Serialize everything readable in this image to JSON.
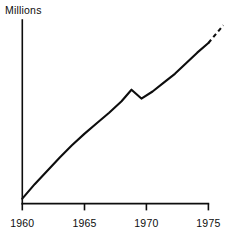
{
  "chart_data": {
    "type": "line",
    "title": "",
    "subtitle": "",
    "xlabel": "",
    "ylabel": "Millions",
    "xlim": [
      1960,
      1976.2
    ],
    "ylim": [
      0,
      10.4
    ],
    "grid": false,
    "legend": null,
    "axis_style": "L-shaped spine, ticks below x-axis, no y-axis tick labels",
    "xticks": [
      1960,
      1965,
      1970,
      1975
    ],
    "xtick_labels": [
      "1960",
      "1965",
      "1970",
      "1975"
    ],
    "yticks": [],
    "ytick_labels": [],
    "series": [
      {
        "name": "Millions",
        "style": "solid",
        "x": [
          1960,
          1961,
          1962,
          1963,
          1964,
          1965,
          1966,
          1967,
          1968,
          1968.8,
          1969.6,
          1970.5,
          1971.4,
          1972.3,
          1973.2,
          1974.1,
          1975
        ],
        "values": [
          0.28,
          1.1,
          1.85,
          2.6,
          3.3,
          3.95,
          4.55,
          5.15,
          5.8,
          6.45,
          5.95,
          6.35,
          6.85,
          7.35,
          7.95,
          8.55,
          9.1
        ]
      },
      {
        "name": "Millions (projection)",
        "style": "dashed",
        "x": [
          1975,
          1975.6,
          1976.2
        ],
        "values": [
          9.1,
          9.6,
          10.1
        ]
      }
    ],
    "annotations": [
      {
        "text": "Millions",
        "role": "y-axis-title",
        "x": 1960,
        "y": 10.4
      }
    ]
  }
}
